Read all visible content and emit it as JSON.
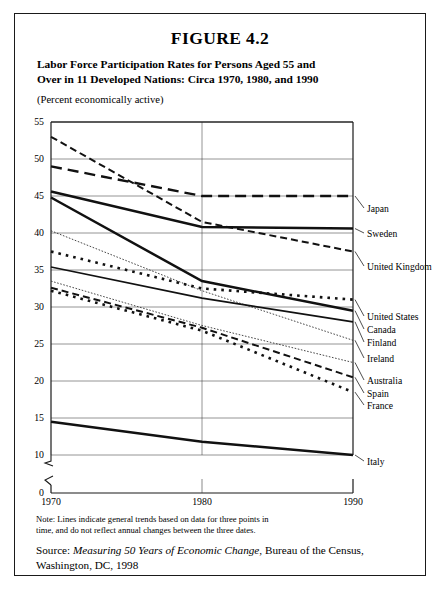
{
  "figure": {
    "number": "FIGURE 4.2",
    "title_line1": "Labor Force Participation Rates for Persons Aged 55 and",
    "title_line2": "Over in 11 Developed Nations:  Circa 1970, 1980, and 1990",
    "subtitle": "(Percent economically active)"
  },
  "note": {
    "line1": "Note:  Lines indicate general trends based on data for three points in",
    "line2": "time, and do not reflect annual changes between the three dates."
  },
  "source": {
    "prefix": "Source: ",
    "italic_title": "Measuring 50 Years of Economic Change",
    "suffix": ", Bureau of the Census,",
    "line2": "Washington, DC, 1998"
  },
  "chart_data": {
    "type": "line",
    "title": "Labor Force Participation Rates for Persons Aged 55 and Over in 11 Developed Nations: Circa 1970, 1980, and 1990",
    "subtitle": "(Percent economically active)",
    "xlabel": "",
    "ylabel": "",
    "x": [
      "1970",
      "1980",
      "1990"
    ],
    "x_tick_labels": [
      "1970",
      "1980",
      "1990"
    ],
    "y_tick_labels": [
      "0",
      "10",
      "15",
      "20",
      "25",
      "30",
      "35",
      "40",
      "45",
      "50",
      "55"
    ],
    "ylim": [
      10,
      55
    ],
    "y_axis_break": true,
    "y_axis_break_between": [
      0,
      10
    ],
    "grid": true,
    "grid_axis": "both",
    "legend_position": "right-of-plot",
    "series": [
      {
        "name": "United Kingdom",
        "values": [
          53.0,
          41.5,
          37.5
        ],
        "style": "dashed",
        "label_y_value": 37.5
      },
      {
        "name": "Japan",
        "values": [
          49.0,
          45.0,
          45.0
        ],
        "style": "long-dash",
        "label_y_value": 45.0
      },
      {
        "name": "Sweden",
        "values": [
          45.6,
          40.8,
          40.6
        ],
        "style": "solid-thick",
        "label_y_value": 40.6
      },
      {
        "name": "Canada",
        "values": [
          44.8,
          33.5,
          29.5
        ],
        "style": "solid-thick",
        "label_y_value": 29.5
      },
      {
        "name": "Ireland",
        "values": [
          40.3,
          32.2,
          25.5
        ],
        "style": "thin-dotted",
        "label_y_value": 25.5
      },
      {
        "name": "United States",
        "values": [
          37.5,
          32.5,
          31.0
        ],
        "style": "square-dotted",
        "label_y_value": 31.0
      },
      {
        "name": "Finland",
        "values": [
          35.4,
          31.2,
          28.0
        ],
        "style": "solid-medium",
        "label_y_value": 28.0
      },
      {
        "name": "Australia",
        "values": [
          33.5,
          27.5,
          22.5
        ],
        "style": "thin-dotted",
        "label_y_value": 22.5
      },
      {
        "name": "Spain",
        "values": [
          32.6,
          27.2,
          20.5
        ],
        "style": "dashed",
        "label_y_value": 20.5
      },
      {
        "name": "France",
        "values": [
          32.2,
          26.8,
          18.5
        ],
        "style": "square-dotted",
        "label_y_value": 18.5
      },
      {
        "name": "Italy",
        "values": [
          14.5,
          11.8,
          10.0
        ],
        "style": "solid-thick",
        "label_y_value": 10.0
      }
    ]
  }
}
